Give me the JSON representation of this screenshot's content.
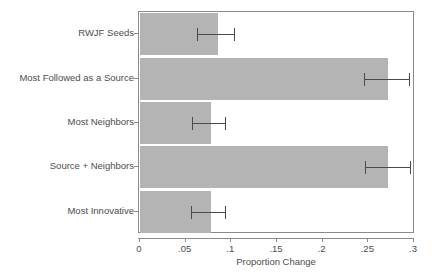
{
  "chart_data": {
    "type": "bar",
    "orientation": "horizontal",
    "title": "",
    "xlabel": "Proportion Change",
    "ylabel": "",
    "xlim": [
      0,
      0.3
    ],
    "xticks": [
      "0",
      ".05",
      ".1",
      ".15",
      ".2",
      ".25",
      ".3"
    ],
    "xtick_values": [
      0,
      0.05,
      0.1,
      0.15,
      0.2,
      0.25,
      0.3
    ],
    "grid": false,
    "legend": "none",
    "categories": [
      "RWJF Seeds",
      "Most Followed as a Source",
      "Most Neighbors",
      "Source + Neighbors",
      "Most Innovative"
    ],
    "values": [
      0.085,
      0.271,
      0.078,
      0.272,
      0.078
    ],
    "error_low": [
      0.062,
      0.245,
      0.057,
      0.246,
      0.056
    ],
    "error_high": [
      0.104,
      0.296,
      0.094,
      0.297,
      0.094
    ],
    "bar_color": "#b4b4b4",
    "error_color": "#4a4a4a",
    "frame_color": "#8c8c8c"
  }
}
